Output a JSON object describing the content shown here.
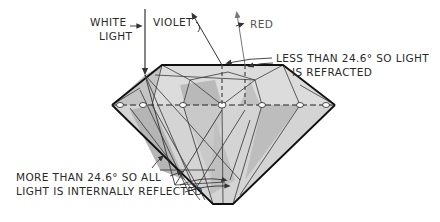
{
  "diagram": {
    "labels": {
      "white_light_line1": "WHITE",
      "white_light_line2": "LIGHT",
      "violet": "VIOLET",
      "red": "RED",
      "refracted_line1": "LESS THAN 24.6° SO LIGHT",
      "refracted_line2": "IS REFRACTED",
      "reflected_line1": "MORE THAN 24.6°  SO ALL",
      "reflected_line2": "LIGHT IS INTERNALLY REFLECTED"
    },
    "colors": {
      "outline": "#1a1a1a",
      "crown_fill": "#dcdcdc",
      "facet_dark": "#b8b8b8",
      "facet_mid": "#c8c8c8",
      "pavilion_fill": "#d4d4d4",
      "background": "#ffffff"
    },
    "critical_angle_deg": 24.6
  }
}
